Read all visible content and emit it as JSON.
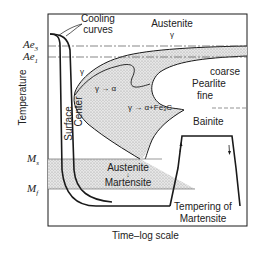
{
  "diagram": {
    "type": "TTT diagram with quench and temper (martempering) cooling curves",
    "axes": {
      "xlabel": "Time–log scale",
      "ylabel": "Temperature"
    },
    "temperature_marks": {
      "ae3": "Ae",
      "ae3_sub": "3",
      "ae1": "Ae",
      "ae1_sub": "1",
      "ms": "M",
      "ms_sub": "s",
      "mf": "M",
      "mf_sub": "f"
    },
    "labels": {
      "cooling_curves_line1": "Cooling",
      "cooling_curves_line2": "curves",
      "austenite": "Austenite",
      "austenite_gamma": "γ",
      "gamma": "γ",
      "gamma_to_alpha": "γ → α",
      "gamma_to_alpha_fe3c": "γ → α+Fe₃C",
      "coarse": "coarse",
      "pearlite": "Pearlite",
      "fine": "fine",
      "bainite": "Bainite",
      "surface": "Surface",
      "center": "Center",
      "austenite_martensite_line1": "Austenite",
      "austenite_martensite_arrow": "↓",
      "austenite_martensite_line2": "Martensite",
      "tempering_line1": "Tempering of",
      "tempering_line2": "Martensite"
    },
    "colors": {
      "line": "#1a1a1a",
      "shade": "#d9d9d9",
      "background": "#ffffff"
    }
  }
}
